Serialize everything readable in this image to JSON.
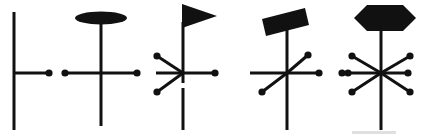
{
  "figure": {
    "canvas": {
      "width": 422,
      "height": 136
    },
    "colors": {
      "ink": "#111111",
      "background": "#ffffff",
      "artifact": "#777777"
    },
    "stroke": {
      "stem_width": 3.0,
      "bar_width": 3.0,
      "arm_width": 3.0,
      "dot_radius": 3.6
    },
    "symbols": [
      {
        "index": 1,
        "name": "symbol-plain-stem",
        "head": "none",
        "head_label": "(no head)",
        "stem": {
          "x": 14,
          "y_top": 12,
          "y_bottom": 130
        },
        "bar": {
          "y": 73,
          "x_left": 14,
          "x_right": 49
        },
        "arms": [],
        "dots": [
          {
            "x": 49,
            "y": 73
          }
        ]
      },
      {
        "index": 2,
        "name": "symbol-ellipse-head",
        "head": "ellipse",
        "head_label": "flat filled ellipse",
        "head_geom": {
          "cx": 101,
          "cy": 18,
          "rx": 26,
          "ry": 6.5
        },
        "stem": {
          "x": 101,
          "y_top": 22,
          "y_bottom": 126
        },
        "bar": {
          "y": 73,
          "x_left": 62,
          "x_right": 140
        },
        "arms": [],
        "dots": [
          {
            "x": 65,
            "y": 73
          },
          {
            "x": 137,
            "y": 73
          }
        ]
      },
      {
        "index": 3,
        "name": "symbol-pennant-head",
        "head": "triangle-right",
        "head_label": "right-pointing filled pennant",
        "head_geom": {
          "x1": 182,
          "y1": 4,
          "x2": 217,
          "y2": 16,
          "x3": 182,
          "y3": 28
        },
        "stem": {
          "x": 183,
          "y_top": 22,
          "y_bottom": 130
        },
        "bar": {
          "y": 73,
          "x_left": 156,
          "x_right": 218
        },
        "arms": [
          {
            "name": "arm-upper-left",
            "x2": 157,
            "y2": 56
          },
          {
            "name": "arm-lower-left",
            "x2": 157,
            "y2": 92
          }
        ],
        "dots": [
          {
            "x": 157,
            "y": 56
          },
          {
            "x": 157,
            "y": 92
          },
          {
            "x": 215,
            "y": 73
          }
        ]
      },
      {
        "index": 4,
        "name": "symbol-parallelogram-head",
        "head": "parallelogram",
        "head_label": "tilted filled parallelogram",
        "head_geom": {
          "x1": 262,
          "y1": 19,
          "x2": 305,
          "y2": 8,
          "x3": 309,
          "y3": 25,
          "x4": 266,
          "y4": 36
        },
        "stem": {
          "x": 287,
          "y_top": 24,
          "y_bottom": 130
        },
        "bar": {
          "y": 73,
          "x_left": 250,
          "x_right": 322
        },
        "arms": [
          {
            "name": "arm-upper-right",
            "x2": 308,
            "y2": 55
          },
          {
            "name": "arm-lower-left",
            "x2": 262,
            "y2": 92
          }
        ],
        "dots": [
          {
            "x": 308,
            "y": 55
          },
          {
            "x": 262,
            "y": 92
          },
          {
            "x": 319,
            "y": 73
          },
          {
            "x": 342,
            "y": 73
          }
        ]
      },
      {
        "index": 5,
        "name": "symbol-hexagon-head",
        "head": "hexagon",
        "head_label": "filled hexagon",
        "head_geom": {
          "cx": 385,
          "cy": 18,
          "w": 62,
          "h": 27,
          "notch": 13
        },
        "stem": {
          "x": 381,
          "y_top": 30,
          "y_bottom": 130
        },
        "bar": {
          "y": 73,
          "x_left": 345,
          "x_right": 411
        },
        "arms": [
          {
            "name": "arm-upper-left",
            "x2": 352,
            "y2": 56
          },
          {
            "name": "arm-upper-right",
            "x2": 410,
            "y2": 56
          },
          {
            "name": "arm-lower-left",
            "x2": 352,
            "y2": 92
          },
          {
            "name": "arm-lower-right",
            "x2": 410,
            "y2": 92
          }
        ],
        "dots": [
          {
            "x": 352,
            "y": 56
          },
          {
            "x": 410,
            "y": 56
          },
          {
            "x": 352,
            "y": 92
          },
          {
            "x": 410,
            "y": 92
          },
          {
            "x": 408,
            "y": 73
          },
          {
            "x": 348,
            "y": 73
          }
        ]
      }
    ],
    "artifacts": [
      {
        "name": "scan-speck-bottom-right",
        "x": 352,
        "y": 130,
        "w": 44,
        "h": 5
      },
      {
        "name": "stem-break-symbol-3",
        "x": 182,
        "y": 84,
        "w": 3,
        "h": 4
      }
    ]
  }
}
